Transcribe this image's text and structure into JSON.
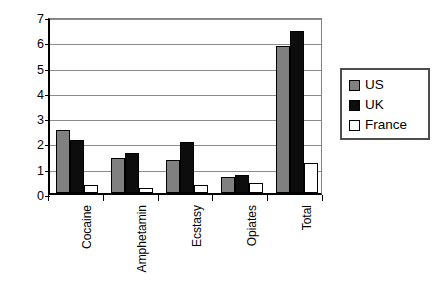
{
  "chart_data": {
    "type": "bar",
    "title": "",
    "subtitle": "",
    "xlabel": "",
    "ylabel": "",
    "categories": [
      "Cocaine",
      "Amphetamin",
      "Ecstasy",
      "Opiates",
      "Total"
    ],
    "series": [
      {
        "name": "US",
        "color": "#808080",
        "values": [
          2.5,
          1.4,
          1.3,
          0.65,
          5.8
        ]
      },
      {
        "name": "UK",
        "color": "#0d0d0d",
        "values": [
          2.1,
          1.6,
          2.0,
          0.7,
          6.4
        ]
      },
      {
        "name": "France",
        "color": "#ffffff",
        "values": [
          0.3,
          0.2,
          0.3,
          0.4,
          1.2
        ]
      }
    ],
    "ylim": [
      0,
      7
    ],
    "ytick_labels": [
      "0",
      "1",
      "2",
      "3",
      "4",
      "5",
      "6",
      "7"
    ],
    "ytick_values": [
      0,
      1,
      2,
      3,
      4,
      5,
      6,
      7
    ],
    "grid": true,
    "legend_position": "right",
    "legend_entries": [
      "US",
      "UK",
      "France"
    ],
    "annotations": []
  },
  "legend": {
    "items": [
      {
        "label": "US"
      },
      {
        "label": "UK"
      },
      {
        "label": "France"
      }
    ]
  }
}
